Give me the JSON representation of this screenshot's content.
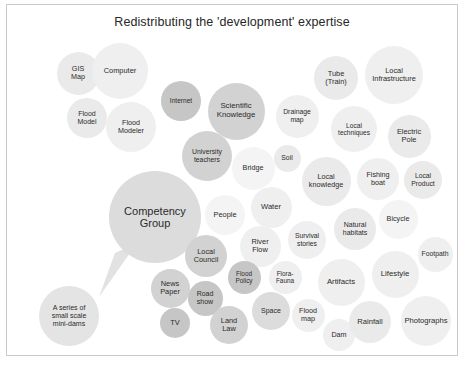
{
  "title": "Redistributing the 'development' expertise",
  "diagram": {
    "type": "bubble-cluster",
    "background": "#ffffff",
    "border_color": "#c9c9c9",
    "text_color": "#2b2b2b",
    "callout": {
      "from": "Competency Group",
      "to": "A series of small scale mini-dams"
    },
    "bubbles": [
      {
        "label": "GIS Map",
        "lines": [
          "GIS",
          "Map"
        ],
        "x": 71,
        "y": 68,
        "d": 43,
        "shade": "s3",
        "fs": 7.2
      },
      {
        "label": "Computer",
        "lines": [
          "Computer"
        ],
        "x": 113,
        "y": 66,
        "d": 56,
        "shade": "s2",
        "fs": 7.4
      },
      {
        "label": "Flood Model",
        "lines": [
          "Flood",
          "Model"
        ],
        "x": 80,
        "y": 113,
        "d": 40,
        "shade": "s3",
        "fs": 7.0
      },
      {
        "label": "Flood Modeler",
        "lines": [
          "Flood",
          "Modeler"
        ],
        "x": 124,
        "y": 122,
        "d": 50,
        "shade": "s2",
        "fs": 7.2
      },
      {
        "label": "Internet",
        "lines": [
          "Internet"
        ],
        "x": 174,
        "y": 96,
        "d": 40,
        "shade": "s7",
        "fs": 6.6
      },
      {
        "label": "Scientific Knowledge",
        "lines": [
          "Scientific",
          "Knowledge"
        ],
        "x": 229,
        "y": 106,
        "d": 57,
        "shade": "s6",
        "fs": 7.8
      },
      {
        "label": "University teachers",
        "lines": [
          "University",
          "teachers"
        ],
        "x": 200,
        "y": 151,
        "d": 50,
        "shade": "s6",
        "fs": 6.8
      },
      {
        "label": "Bridge",
        "lines": [
          "Bridge"
        ],
        "x": 246,
        "y": 163,
        "d": 43,
        "shade": "s1",
        "fs": 7.2
      },
      {
        "label": "Drainage map",
        "lines": [
          "Drainage",
          "map"
        ],
        "x": 290,
        "y": 111,
        "d": 43,
        "shade": "s2",
        "fs": 6.8
      },
      {
        "label": "Soil",
        "lines": [
          "Soil"
        ],
        "x": 280,
        "y": 153,
        "d": 27,
        "shade": "s3",
        "fs": 6.8
      },
      {
        "label": "Tube (Train)",
        "lines": [
          "Tube",
          "(Train)"
        ],
        "x": 329,
        "y": 73,
        "d": 44,
        "shade": "s3",
        "fs": 7.4
      },
      {
        "label": "Local Infrastructure",
        "lines": [
          "Local",
          "Infrastructure"
        ],
        "x": 387,
        "y": 70,
        "d": 58,
        "shade": "s2",
        "fs": 7.4
      },
      {
        "label": "Local techniques",
        "lines": [
          "Local",
          "techniques"
        ],
        "x": 347,
        "y": 124,
        "d": 46,
        "shade": "s2",
        "fs": 6.6
      },
      {
        "label": "Electric Pole",
        "lines": [
          "Electric",
          "Pole"
        ],
        "x": 402,
        "y": 131,
        "d": 43,
        "shade": "s3",
        "fs": 7.4
      },
      {
        "label": "Local knowledge",
        "lines": [
          "Local",
          "knowledge"
        ],
        "x": 319,
        "y": 176,
        "d": 49,
        "shade": "s3",
        "fs": 7.2
      },
      {
        "label": "Fishing boat",
        "lines": [
          "Fishing",
          "boat"
        ],
        "x": 371,
        "y": 174,
        "d": 42,
        "shade": "s2",
        "fs": 7.2
      },
      {
        "label": "Local Product",
        "lines": [
          "Local",
          "Product"
        ],
        "x": 416,
        "y": 175,
        "d": 38,
        "shade": "s3",
        "fs": 6.8
      },
      {
        "label": "Competency Group",
        "lines": [
          "Competency",
          "Group"
        ],
        "x": 148,
        "y": 212,
        "d": 92,
        "shade": "s5",
        "fs": 11.0
      },
      {
        "label": "People",
        "lines": [
          "People"
        ],
        "x": 218,
        "y": 210,
        "d": 40,
        "shade": "s1",
        "fs": 7.4
      },
      {
        "label": "Water",
        "lines": [
          "Water"
        ],
        "x": 264,
        "y": 202,
        "d": 41,
        "shade": "s2",
        "fs": 7.6
      },
      {
        "label": "Natural habitats",
        "lines": [
          "Natural",
          "habitats"
        ],
        "x": 348,
        "y": 224,
        "d": 42,
        "shade": "s3",
        "fs": 7.0
      },
      {
        "label": "Bicycle",
        "lines": [
          "Bicycle"
        ],
        "x": 391,
        "y": 214,
        "d": 39,
        "shade": "s1",
        "fs": 7.2
      },
      {
        "label": "Survival stories",
        "lines": [
          "Survival",
          "stories"
        ],
        "x": 300,
        "y": 235,
        "d": 38,
        "shade": "s2",
        "fs": 6.8
      },
      {
        "label": "River Flow",
        "lines": [
          "River",
          "Flow"
        ],
        "x": 253,
        "y": 241,
        "d": 41,
        "shade": "s2",
        "fs": 7.4
      },
      {
        "label": "Footpath",
        "lines": [
          "Footpath"
        ],
        "x": 428,
        "y": 249,
        "d": 35,
        "shade": "s2",
        "fs": 6.8
      },
      {
        "label": "Local Council",
        "lines": [
          "Local",
          "Council"
        ],
        "x": 199,
        "y": 251,
        "d": 42,
        "shade": "s6",
        "fs": 7.4
      },
      {
        "label": "Flood Policy",
        "lines": [
          "Flood",
          "Policy"
        ],
        "x": 237,
        "y": 272,
        "d": 33,
        "shade": "s7",
        "fs": 6.4
      },
      {
        "label": "Flora-Fauna",
        "lines": [
          "Flora-",
          "Fauna"
        ],
        "x": 278,
        "y": 272,
        "d": 33,
        "shade": "s2",
        "fs": 6.4
      },
      {
        "label": "Artifacts",
        "lines": [
          "Artifacts"
        ],
        "x": 334,
        "y": 277,
        "d": 47,
        "shade": "s2",
        "fs": 7.8
      },
      {
        "label": "Lifestyle",
        "lines": [
          "Lifestyle"
        ],
        "x": 388,
        "y": 269,
        "d": 47,
        "shade": "s2",
        "fs": 7.8
      },
      {
        "label": "News Paper",
        "lines": [
          "News",
          "Paper"
        ],
        "x": 163,
        "y": 283,
        "d": 39,
        "shade": "s6",
        "fs": 7.4
      },
      {
        "label": "Road show",
        "lines": [
          "Road",
          "show"
        ],
        "x": 198,
        "y": 293,
        "d": 35,
        "shade": "s7",
        "fs": 7.0
      },
      {
        "label": "TV",
        "lines": [
          "TV"
        ],
        "x": 168,
        "y": 318,
        "d": 30,
        "shade": "s7",
        "fs": 7.4
      },
      {
        "label": "Land Law",
        "lines": [
          "Land",
          "Law"
        ],
        "x": 222,
        "y": 320,
        "d": 38,
        "shade": "s6",
        "fs": 7.4
      },
      {
        "label": "Space",
        "lines": [
          "Space"
        ],
        "x": 264,
        "y": 306,
        "d": 38,
        "shade": "s5",
        "fs": 7.0
      },
      {
        "label": "Flood map",
        "lines": [
          "Flood",
          "map"
        ],
        "x": 301,
        "y": 310,
        "d": 33,
        "shade": "s2",
        "fs": 7.2
      },
      {
        "label": "Dam",
        "lines": [
          "Dam"
        ],
        "x": 332,
        "y": 330,
        "d": 32,
        "shade": "s2",
        "fs": 7.2
      },
      {
        "label": "Rainfall",
        "lines": [
          "Rainfall"
        ],
        "x": 363,
        "y": 317,
        "d": 42,
        "shade": "s3",
        "fs": 7.6
      },
      {
        "label": "Photographs",
        "lines": [
          "Photographs"
        ],
        "x": 419,
        "y": 316,
        "d": 50,
        "shade": "s2",
        "fs": 7.6
      },
      {
        "label": "A series of small scale mini-dams",
        "lines": [
          "A series of",
          "small scale",
          "mini-dams"
        ],
        "x": 62,
        "y": 311,
        "d": 60,
        "shade": "s4",
        "fs": 7.0
      }
    ]
  }
}
